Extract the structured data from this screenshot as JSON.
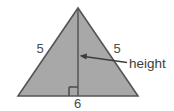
{
  "figure": {
    "type": "geometry-diagram",
    "shape": "isosceles-triangle",
    "background_color": "#ffffff",
    "fill_color": "#a8a8a8",
    "stroke_color": "#555555",
    "text_color": "#4a4a4a",
    "labels": {
      "left_side": "5",
      "right_side": "5",
      "base": "6",
      "height_annotation": "height"
    },
    "vertices": {
      "apex": [
        78,
        8
      ],
      "base_left": [
        18,
        96
      ],
      "base_right": [
        138,
        96
      ]
    },
    "height_segment": {
      "from": [
        78,
        8
      ],
      "to": [
        78,
        96
      ]
    },
    "right_angle_marker": {
      "x": 69,
      "y": 87,
      "size": 9
    },
    "arrow": {
      "tail": [
        127,
        62
      ],
      "head": [
        80,
        56
      ],
      "direction": "left"
    }
  }
}
